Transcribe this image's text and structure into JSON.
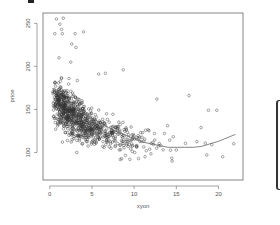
{
  "chart_data": {
    "type": "scatter",
    "title": "",
    "xlabel": "xyon",
    "ylabel": "price",
    "xlim": [
      -0.8,
      22.9
    ],
    "ylim": [
      68,
      262
    ],
    "x_ticks": [
      0,
      5,
      10,
      15,
      20
    ],
    "y_ticks": [
      100,
      150,
      200,
      250
    ],
    "x_tick_labels": [
      "0",
      "5",
      "10",
      "15",
      "20"
    ],
    "y_tick_labels": [
      "100",
      "150",
      "200",
      "250"
    ],
    "grid": false,
    "legend": null,
    "marker": "open-circle",
    "point_color": "#333333",
    "smooth_line": {
      "type": "loess",
      "color": "#666666",
      "x": [
        0.3,
        1,
        2,
        3,
        4,
        5,
        6,
        7,
        8,
        9,
        10,
        11,
        12,
        13,
        14,
        15,
        16,
        17,
        18,
        19,
        20,
        21,
        22
      ],
      "y": [
        175,
        168,
        160,
        152,
        146,
        140,
        134,
        129,
        124,
        120,
        116,
        112,
        110,
        108,
        106,
        106,
        106,
        106,
        107,
        110,
        113,
        117,
        121
      ]
    },
    "series": [
      {
        "name": "observations",
        "approx_count": 900,
        "generator": {
          "x_distribution": "exponential-like, mode ~1-3, tail to 22",
          "y_trend": "decreasing from ~165 at x=0.5 to ~108 at x=15, flattening",
          "spread_sd": 18
        },
        "key_points": [
          {
            "x": 0.8,
            "y": 255
          },
          {
            "x": 1.6,
            "y": 256
          },
          {
            "x": 1.2,
            "y": 249
          },
          {
            "x": 1.4,
            "y": 243
          },
          {
            "x": 0.6,
            "y": 238
          },
          {
            "x": 1.5,
            "y": 238
          },
          {
            "x": 3.0,
            "y": 238
          },
          {
            "x": 4.0,
            "y": 240
          },
          {
            "x": 2.6,
            "y": 226
          },
          {
            "x": 3.1,
            "y": 222
          },
          {
            "x": 1.1,
            "y": 210
          },
          {
            "x": 2.5,
            "y": 205
          },
          {
            "x": 8.7,
            "y": 196
          },
          {
            "x": 5.8,
            "y": 191
          },
          {
            "x": 6.6,
            "y": 192
          },
          {
            "x": 16.5,
            "y": 166
          },
          {
            "x": 12.7,
            "y": 162
          },
          {
            "x": 18.8,
            "y": 149
          },
          {
            "x": 19.8,
            "y": 149
          },
          {
            "x": 21.8,
            "y": 110
          },
          {
            "x": 19.2,
            "y": 109
          },
          {
            "x": 20.5,
            "y": 95
          },
          {
            "x": 14.5,
            "y": 90
          },
          {
            "x": 15.0,
            "y": 103
          },
          {
            "x": 9.5,
            "y": 92
          },
          {
            "x": 3.2,
            "y": 100
          },
          {
            "x": 0.7,
            "y": 127
          },
          {
            "x": 1.5,
            "y": 112
          }
        ]
      }
    ]
  },
  "decorations": {
    "top_mark": "black-rectangle",
    "right_edge": "cropped-panel-bracket"
  }
}
